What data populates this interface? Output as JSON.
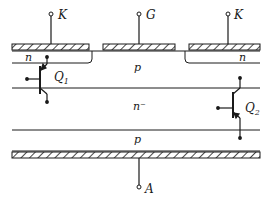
{
  "diagram": {
    "type": "thyristor-cross-section",
    "terminals": {
      "cathode_left": "K",
      "gate": "G",
      "cathode_right": "K",
      "anode": "A"
    },
    "regions": {
      "n_left": "n",
      "p_top": "p",
      "n_right": "n",
      "n_minus": "n⁻",
      "p_bottom": "p"
    },
    "transistors": {
      "q1": {
        "label": "Q",
        "sub": "1"
      },
      "q2": {
        "label": "Q",
        "sub": "2"
      }
    },
    "colors": {
      "ink": "#1a1a1a",
      "background": "#ffffff"
    }
  }
}
